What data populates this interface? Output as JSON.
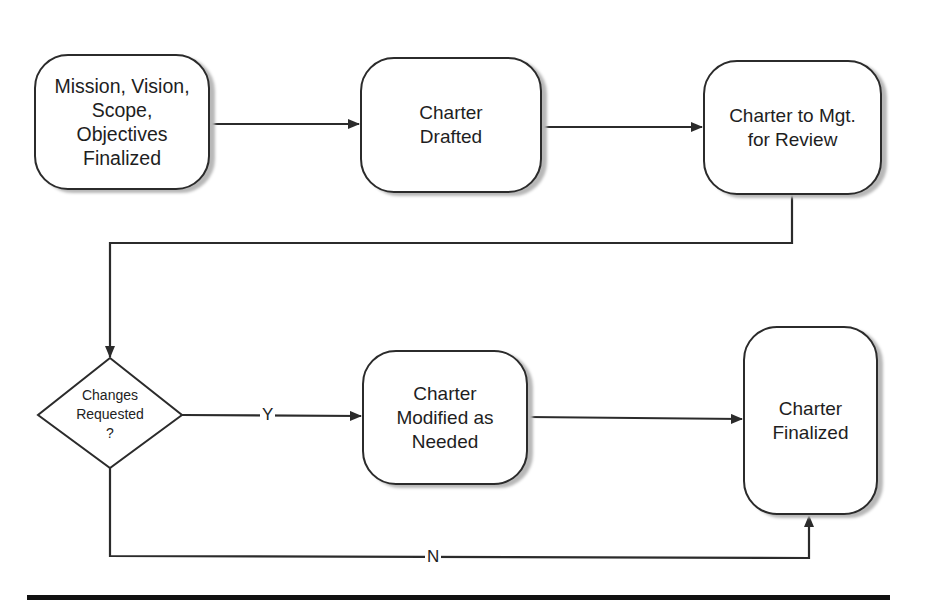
{
  "diagram": {
    "type": "flowchart",
    "nodes": [
      {
        "id": "mission",
        "shape": "rounded-rect",
        "label": "Mission, Vision,\nScope,\nObjectives\nFinalized"
      },
      {
        "id": "drafted",
        "shape": "rounded-rect",
        "label": "Charter\nDrafted"
      },
      {
        "id": "review",
        "shape": "rounded-rect",
        "label": "Charter to Mgt.\nfor Review"
      },
      {
        "id": "decision",
        "shape": "diamond",
        "label": "Changes\nRequested\n?"
      },
      {
        "id": "modified",
        "shape": "rounded-rect",
        "label": "Charter\nModified as\nNeeded"
      },
      {
        "id": "finalized",
        "shape": "rounded-rect",
        "label": "Charter\nFinalized"
      }
    ],
    "edges": [
      {
        "from": "mission",
        "to": "drafted",
        "label": ""
      },
      {
        "from": "drafted",
        "to": "review",
        "label": ""
      },
      {
        "from": "review",
        "to": "decision",
        "label": ""
      },
      {
        "from": "decision",
        "to": "modified",
        "label": "Y"
      },
      {
        "from": "modified",
        "to": "finalized",
        "label": ""
      },
      {
        "from": "decision",
        "to": "finalized",
        "label": "N"
      }
    ],
    "colors": {
      "stroke": "#2b2b2b",
      "shadow": "#b8b8b8",
      "background": "#ffffff",
      "rule": "#111111"
    }
  }
}
